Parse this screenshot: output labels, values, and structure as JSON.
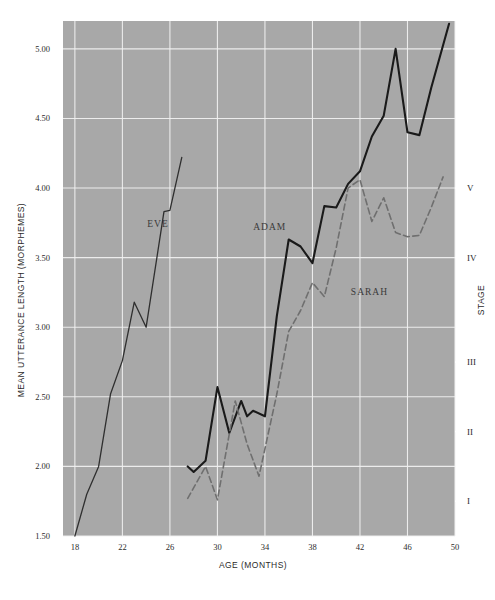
{
  "chart_data": {
    "type": "line",
    "title": "",
    "xlabel": "AGE (MONTHS)",
    "ylabel": "MEAN UTTERANCE LENGTH (MORPHEMES)",
    "y2label": "STAGE",
    "xlim": [
      17,
      50
    ],
    "ylim": [
      1.5,
      5.2
    ],
    "grid": true,
    "legend": "inline-labels",
    "plot_bg": "#a8a8a8",
    "gridline_color": "#f2f2f2",
    "page_bg": "#ffffff",
    "xticks": [
      18,
      22,
      26,
      30,
      34,
      38,
      42,
      46,
      50
    ],
    "xtick_labels": [
      "18",
      "22",
      "26",
      "30",
      "34",
      "38",
      "42",
      "46",
      "50"
    ],
    "yticks": [
      1.5,
      2.0,
      2.5,
      3.0,
      3.5,
      4.0,
      4.5,
      5.0
    ],
    "ytick_labels": [
      "1.50",
      "2.00",
      "2.50",
      "3.00",
      "3.50",
      "4.00",
      "4.50",
      "5.00"
    ],
    "y_minor_step": 0.1,
    "stage_ticks": [
      {
        "label": "I",
        "value": 1.75
      },
      {
        "label": "II",
        "value": 2.25
      },
      {
        "label": "III",
        "value": 2.75
      },
      {
        "label": "IV",
        "value": 3.5
      },
      {
        "label": "V",
        "value": 4.0
      }
    ],
    "series": [
      {
        "name": "EVE",
        "color": "#2f2f2f",
        "style": "solid",
        "width": 1.3,
        "label_x": 25.0,
        "label_y": 3.72,
        "points": [
          [
            18.0,
            1.5
          ],
          [
            19.0,
            1.8
          ],
          [
            20.0,
            2.0
          ],
          [
            21.0,
            2.52
          ],
          [
            22.0,
            2.76
          ],
          [
            23.0,
            3.18
          ],
          [
            24.0,
            3.0
          ],
          [
            25.5,
            3.83
          ],
          [
            26.0,
            3.84
          ],
          [
            27.0,
            4.22
          ]
        ]
      },
      {
        "name": "ADAM",
        "color": "#1a1a1a",
        "style": "solid",
        "width": 2.1,
        "label_x": 34.4,
        "label_y": 3.7,
        "points": [
          [
            27.5,
            2.0
          ],
          [
            28.0,
            1.96
          ],
          [
            29.0,
            2.04
          ],
          [
            30.0,
            2.57
          ],
          [
            31.0,
            2.24
          ],
          [
            32.0,
            2.47
          ],
          [
            32.5,
            2.36
          ],
          [
            33.0,
            2.4
          ],
          [
            34.0,
            2.36
          ],
          [
            35.0,
            3.08
          ],
          [
            36.0,
            3.63
          ],
          [
            37.0,
            3.58
          ],
          [
            38.0,
            3.46
          ],
          [
            39.0,
            3.87
          ],
          [
            40.0,
            3.86
          ],
          [
            41.0,
            4.03
          ],
          [
            42.0,
            4.12
          ],
          [
            43.0,
            4.37
          ],
          [
            44.0,
            4.52
          ],
          [
            45.0,
            5.0
          ],
          [
            46.0,
            4.4
          ],
          [
            47.0,
            4.38
          ],
          [
            48.0,
            4.72
          ],
          [
            49.5,
            5.18
          ]
        ]
      },
      {
        "name": "SARAH",
        "color": "#6f6f6f",
        "style": "dashed",
        "width": 1.6,
        "label_x": 42.8,
        "label_y": 3.23,
        "points": [
          [
            27.5,
            1.77
          ],
          [
            29.0,
            2.0
          ],
          [
            30.0,
            1.76
          ],
          [
            31.5,
            2.47
          ],
          [
            32.5,
            2.16
          ],
          [
            33.5,
            1.93
          ],
          [
            35.0,
            2.52
          ],
          [
            36.0,
            2.97
          ],
          [
            37.0,
            3.12
          ],
          [
            38.0,
            3.32
          ],
          [
            39.0,
            3.22
          ],
          [
            40.0,
            3.57
          ],
          [
            41.0,
            4.0
          ],
          [
            42.0,
            4.06
          ],
          [
            43.0,
            3.76
          ],
          [
            44.0,
            3.93
          ],
          [
            45.0,
            3.68
          ],
          [
            46.0,
            3.65
          ],
          [
            47.0,
            3.66
          ],
          [
            48.0,
            3.86
          ],
          [
            49.0,
            4.08
          ]
        ]
      }
    ]
  }
}
